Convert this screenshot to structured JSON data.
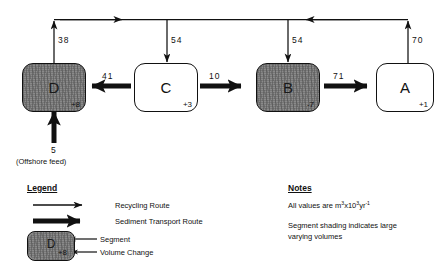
{
  "diagram": {
    "segments": [
      {
        "id": "D",
        "label": "D",
        "volume_change": "+8",
        "shaded": true
      },
      {
        "id": "C",
        "label": "C",
        "volume_change": "+3",
        "shaded": false
      },
      {
        "id": "B",
        "label": "B",
        "volume_change": "-7",
        "shaded": true
      },
      {
        "id": "A",
        "label": "A",
        "volume_change": "+1",
        "shaded": false
      }
    ],
    "transport_flows": [
      {
        "from": "C",
        "to": "D",
        "value": "41",
        "direction": "left"
      },
      {
        "from": "C",
        "to": "B",
        "value": "10",
        "direction": "right"
      },
      {
        "from": "B",
        "to": "A",
        "value": "71",
        "direction": "right"
      }
    ],
    "recycling_flows": [
      {
        "from": "D",
        "to": "trunk",
        "value": "38",
        "direction": "up"
      },
      {
        "from": "trunk",
        "to": "C",
        "value": "54",
        "direction": "down"
      },
      {
        "from": "trunk",
        "to": "B",
        "value": "54",
        "direction": "down"
      },
      {
        "from": "A",
        "to": "trunk",
        "value": "70",
        "direction": "up"
      }
    ],
    "input_flow": {
      "value": "5",
      "label": "(Offshore feed)",
      "target": "D",
      "direction": "up"
    }
  },
  "legend": {
    "title": "Legend",
    "items": [
      {
        "key": "recycling-route",
        "label": "Recycling Route"
      },
      {
        "key": "sediment-transport-route",
        "label": "Sediment Transport Route"
      }
    ],
    "sample_segment": {
      "label": "D",
      "volume_change": "+8"
    },
    "callouts": [
      {
        "key": "segment",
        "label": "Segment"
      },
      {
        "key": "volume-change",
        "label": "Volume Change"
      }
    ]
  },
  "notes": {
    "title": "Notes",
    "units_prefix": "All values are m",
    "units_sup1": "3",
    "units_mid": "x10",
    "units_sup2": "3",
    "units_tail": "yr",
    "units_sup3": "-1",
    "shading_note": "Segment shading indicates large varying volumes"
  },
  "colors": {
    "stroke": "#111111",
    "segment_light": "#ffffff",
    "segment_dark": "#8a8a8a",
    "background": "#ffffff"
  }
}
